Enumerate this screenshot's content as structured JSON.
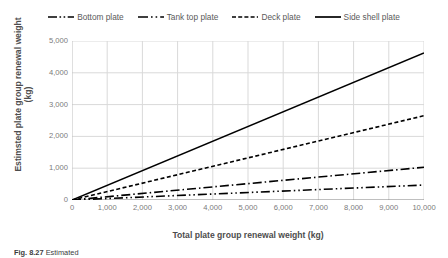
{
  "chart_data": {
    "type": "line",
    "title": "",
    "xlabel": "Total plate group renewal weight (kg)",
    "ylabel": "Estimsted plate group renewal weight (kg)",
    "xlim": [
      0,
      10000
    ],
    "ylim": [
      0,
      5000
    ],
    "xticks": [
      "0",
      "1,000",
      "2,000",
      "3,000",
      "4,000",
      "5,000",
      "6,000",
      "7,000",
      "8,000",
      "9,000",
      "10,000"
    ],
    "yticks": [
      "0",
      "1,000",
      "2,000",
      "3,000",
      "4,000",
      "5,000"
    ],
    "xtick_values": [
      0,
      1000,
      2000,
      3000,
      4000,
      5000,
      6000,
      7000,
      8000,
      9000,
      10000
    ],
    "ytick_values": [
      0,
      1000,
      2000,
      3000,
      4000,
      5000
    ],
    "grid": true,
    "grid_color": "#d9d9d9",
    "legend_position": "top",
    "x": [
      0,
      10000
    ],
    "series": [
      {
        "name": "Bottom plate",
        "values": [
          0,
          470
        ],
        "style": "dash-dot-dot",
        "color": "#000000",
        "dasharray": "9,3,1.5,3,1.5,3",
        "width": 1.6
      },
      {
        "name": "Tank top plate",
        "values": [
          0,
          1030
        ],
        "style": "dash-dot",
        "color": "#000000",
        "dasharray": "9,3,1.5,3",
        "width": 1.6
      },
      {
        "name": "Deck plate",
        "values": [
          0,
          2650
        ],
        "style": "dashed",
        "color": "#000000",
        "dasharray": "4,2.5",
        "width": 1.6
      },
      {
        "name": "Side shell plate",
        "values": [
          0,
          4625
        ],
        "style": "solid",
        "color": "#000000",
        "dasharray": "none",
        "width": 1.6
      }
    ]
  },
  "caption": {
    "figure_number": "Fig. 8.27",
    "text": "Estimated"
  }
}
